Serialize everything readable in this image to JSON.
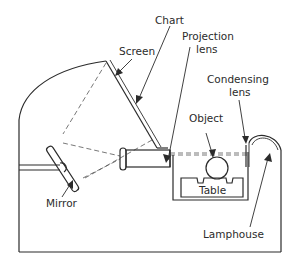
{
  "diagram": {
    "type": "optical projector schematic",
    "labels": {
      "screen": "Screen",
      "chart": "Chart",
      "projection_lens_1": "Projection",
      "projection_lens_2": "lens",
      "condensing_lens_1": "Condensing",
      "condensing_lens_2": "lens",
      "object": "Object",
      "table": "Table",
      "mirror": "Mirror",
      "lamphouse": "Lamphouse"
    },
    "colors": {
      "line": "#2b2b2b",
      "background": "#ffffff"
    }
  }
}
